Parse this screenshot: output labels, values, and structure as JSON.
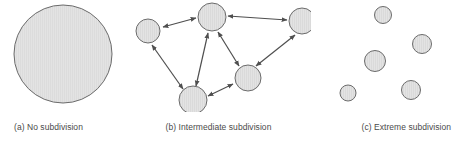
{
  "figure": {
    "width": 457,
    "height": 143,
    "background": "#ffffff",
    "style": {
      "circle_fill": "#e2e2e2",
      "circle_stroke": "#6b6b6b",
      "arrow_color": "#4f4f4f",
      "caption_color": "#4a4a4a"
    }
  },
  "panels": [
    {
      "id": "a",
      "caption": "(a) No subdivision",
      "circle_count": 1,
      "circles": [
        {
          "name": "region-whole",
          "cx": 63,
          "cy": 54,
          "r": 49.5
        }
      ],
      "arrows": []
    },
    {
      "id": "b",
      "caption": "(b) Intermediate subdivision",
      "circle_count": 6,
      "circles": [
        {
          "name": "node-left",
          "cx": 22,
          "cy": 31,
          "r": 12.5
        },
        {
          "name": "node-top-center",
          "cx": 86,
          "cy": 17,
          "r": 14.0
        },
        {
          "name": "node-right",
          "cx": 176,
          "cy": 21,
          "r": 13.5
        },
        {
          "name": "node-mid-right",
          "cx": 122,
          "cy": 78,
          "r": 13.5
        },
        {
          "name": "node-bottom",
          "cx": 67,
          "cy": 100,
          "r": 14.0
        },
        {
          "name": "node-anchor-inner",
          "cx": 86,
          "cy": 17,
          "r": 0
        }
      ],
      "arrows": [
        {
          "name": "arrow-left-to-topcenter",
          "from": "node-left",
          "to": "node-top-center",
          "double": true
        },
        {
          "name": "arrow-topcenter-to-right",
          "from": "node-top-center",
          "to": "node-right",
          "double": true
        },
        {
          "name": "arrow-left-to-bottom",
          "from": "node-left",
          "to": "node-bottom",
          "double": true
        },
        {
          "name": "arrow-bottom-to-topcenter",
          "from": "node-bottom",
          "to": "node-top-center",
          "double": true
        },
        {
          "name": "arrow-bottom-to-midright",
          "from": "node-bottom",
          "to": "node-mid-right",
          "double": true
        },
        {
          "name": "arrow-midright-to-topcenter",
          "from": "node-mid-right",
          "to": "node-top-center",
          "double": true
        },
        {
          "name": "arrow-midright-to-right",
          "from": "node-mid-right",
          "to": "node-right",
          "double": true
        }
      ]
    },
    {
      "id": "c",
      "caption": "(c) Extreme subdivision",
      "circle_count": 5,
      "circles": [
        {
          "name": "fragment-top",
          "cx": 72,
          "cy": 15,
          "r": 9.0
        },
        {
          "name": "fragment-right-upper",
          "cx": 111,
          "cy": 44,
          "r": 10.0
        },
        {
          "name": "fragment-center",
          "cx": 64,
          "cy": 61,
          "r": 11.0
        },
        {
          "name": "fragment-bottom-left",
          "cx": 37,
          "cy": 93,
          "r": 8.5
        },
        {
          "name": "fragment-bottom-right",
          "cx": 100,
          "cy": 90,
          "r": 10.0
        }
      ],
      "arrows": []
    }
  ]
}
